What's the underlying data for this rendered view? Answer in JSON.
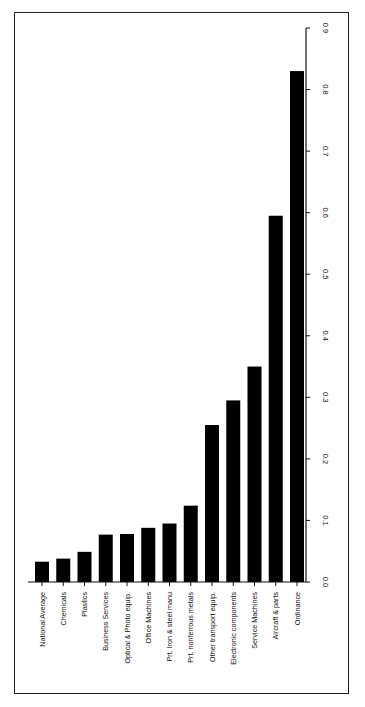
{
  "chart_data": {
    "type": "bar",
    "orientation": "rotated 90 degrees (horizontal bars printed sideways; value axis on right edge)",
    "title": "",
    "xlabel": "",
    "ylabel": "",
    "categories": [
      "National Average",
      "Chemicals",
      "Plastics",
      "Business Services",
      "Optical & Photo equip.",
      "Office Machines",
      "Prt. Iron & steel manu",
      "Prt. nonferrous metals",
      "Other transport equip.",
      "Electronic components",
      "Service Machines",
      "Aircraft & parts",
      "Ordinance"
    ],
    "values": [
      0.033,
      0.038,
      0.049,
      0.077,
      0.078,
      0.088,
      0.095,
      0.124,
      0.255,
      0.295,
      0.35,
      0.595,
      0.83
    ],
    "ylim": [
      0,
      0.9
    ],
    "yticks": [
      "0.0",
      "0.1",
      "0.2",
      "0.3",
      "0.4",
      "0.5",
      "0.6",
      "0.7",
      "0.8",
      "0.9"
    ],
    "grid": false,
    "legend": null,
    "bar_color": "#000000"
  }
}
